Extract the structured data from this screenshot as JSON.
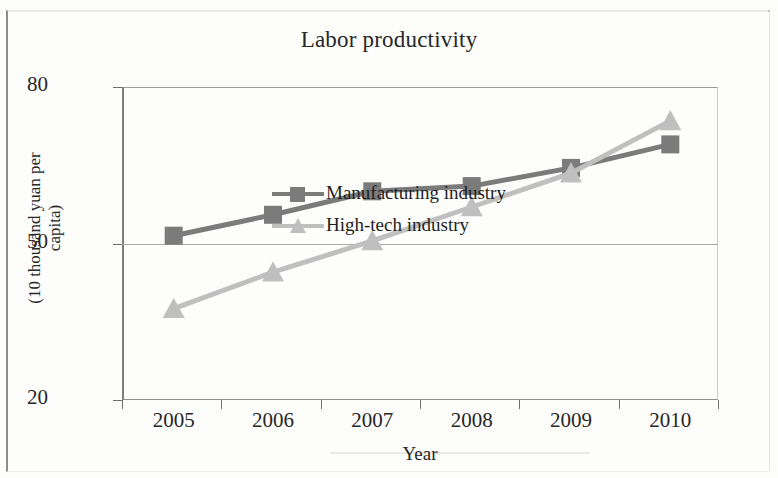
{
  "chart_data": {
    "type": "line",
    "title": "Labor productivity",
    "xlabel": "Year",
    "ylabel": "(10 thousand yuan per capita)",
    "ylabel_line1": "(10  thousand yuan per",
    "ylabel_line2": "capita)",
    "categories": [
      "2005",
      "2006",
      "2007",
      "2008",
      "2009",
      "2010"
    ],
    "ylim": [
      20,
      80
    ],
    "yticks": [
      20,
      50,
      80
    ],
    "ytick_labels": [
      "20",
      "50",
      "80"
    ],
    "grid": "horizontal-at-ticks",
    "legend_position": "inside-top-left",
    "series": [
      {
        "name": "Manufacturing industry",
        "marker": "square",
        "color": "#7b7b7b",
        "values": [
          51.5,
          55.5,
          60.0,
          61.0,
          64.5,
          69.0
        ]
      },
      {
        "name": "High-tech industry",
        "marker": "triangle",
        "color": "#bfbfbf",
        "values": [
          37.5,
          44.5,
          50.5,
          57.0,
          63.5,
          73.5
        ]
      }
    ]
  },
  "legend": {
    "items": [
      {
        "label": "Manufacturing industry"
      },
      {
        "label": "High-tech industry"
      }
    ]
  },
  "colors": {
    "manufacturing": "#7b7b7b",
    "high_tech": "#bfbfbf",
    "axis": "#7d7d7d",
    "text": "#262626",
    "background": "#fdfdfc"
  }
}
